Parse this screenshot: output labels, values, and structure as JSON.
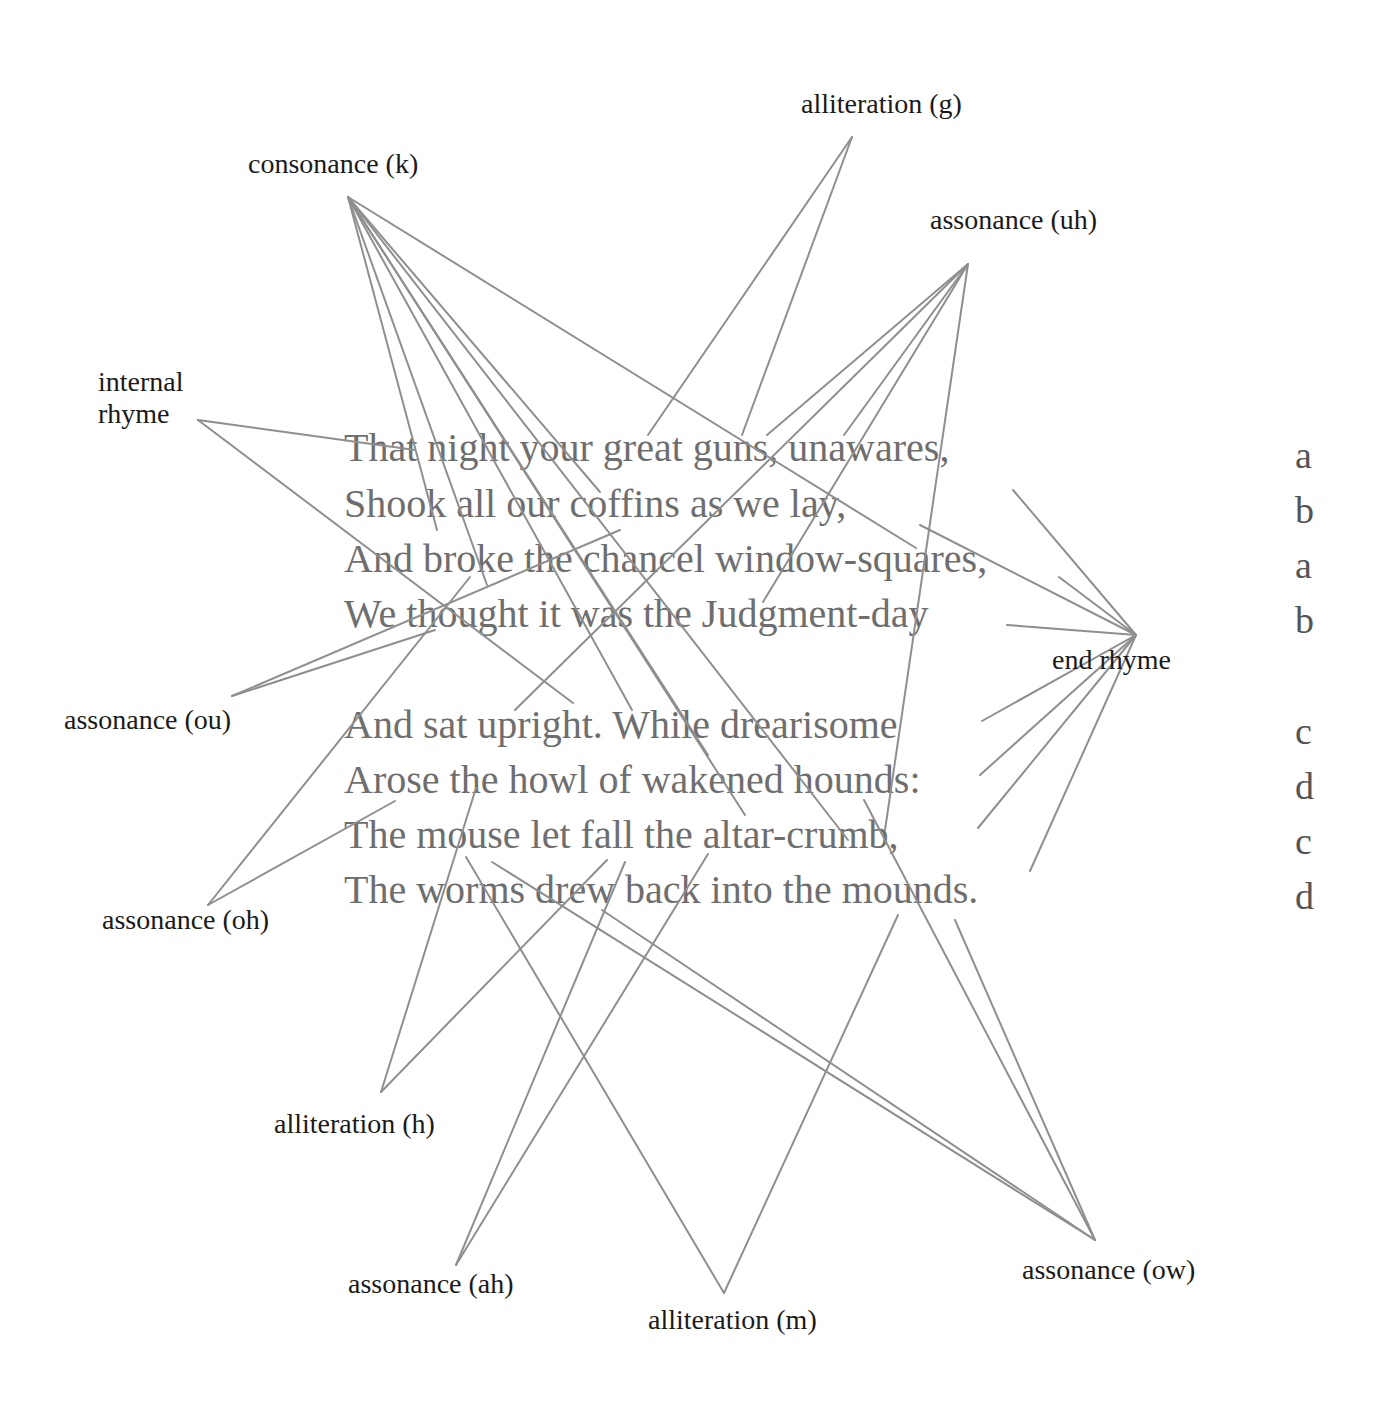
{
  "poem": {
    "stanzas": [
      {
        "lines": [
          {
            "text": "That night your great guns, unawares,",
            "rhyme": "a"
          },
          {
            "text": "Shook all our coffins as we lay,",
            "rhyme": "b"
          },
          {
            "text": "And broke the chancel window-squares,",
            "rhyme": "a"
          },
          {
            "text": "We thought it was the Judgment-day",
            "rhyme": "b"
          }
        ]
      },
      {
        "lines": [
          {
            "text": "And sat upright. While drearisome",
            "rhyme": "c"
          },
          {
            "text": "Arose the howl of wakened hounds:",
            "rhyme": "d"
          },
          {
            "text": "The mouse let fall the altar-crumb,",
            "rhyme": "c"
          },
          {
            "text": "The worms drew back into the mounds.",
            "rhyme": "d"
          }
        ]
      }
    ]
  },
  "labels": {
    "alliteration_g": "alliteration (g)",
    "consonance_k": "consonance (k)",
    "assonance_uh": "assonance (uh)",
    "internal_rhyme_line1": "internal",
    "internal_rhyme_line2": "rhyme",
    "assonance_ou": "assonance (ou)",
    "end_rhyme": "end rhyme",
    "assonance_oh": "assonance (oh)",
    "alliteration_h": "alliteration (h)",
    "assonance_ah": "assonance (ah)",
    "alliteration_m": "alliteration (m)",
    "assonance_ow": "assonance (ow)"
  },
  "colors": {
    "connector": "#8f8f8f",
    "poem_text": "#6e6e6e",
    "label_text": "#1a1a1a",
    "background": "#ffffff"
  },
  "chart_data": {
    "type": "diagram",
    "title": "",
    "nodes": [
      {
        "id": "alliteration_g",
        "label": "alliteration (g)",
        "anchor": [
          852,
          137
        ]
      },
      {
        "id": "consonance_k",
        "label": "consonance (k)",
        "anchor": [
          348,
          197
        ]
      },
      {
        "id": "assonance_uh",
        "label": "assonance (uh)",
        "anchor": [
          968,
          264
        ]
      },
      {
        "id": "internal_rhyme",
        "label": "internal rhyme",
        "anchor": [
          198,
          420
        ]
      },
      {
        "id": "assonance_ou",
        "label": "assonance (ou)",
        "anchor": [
          232,
          696
        ]
      },
      {
        "id": "end_rhyme",
        "label": "end rhyme",
        "anchor": [
          1136,
          635
        ]
      },
      {
        "id": "assonance_oh",
        "label": "assonance (oh)",
        "anchor": [
          208,
          905
        ]
      },
      {
        "id": "alliteration_h",
        "label": "alliteration (h)",
        "anchor": [
          381,
          1092
        ]
      },
      {
        "id": "assonance_ah",
        "label": "assonance (ah)",
        "anchor": [
          456,
          1265
        ]
      },
      {
        "id": "alliteration_m",
        "label": "alliteration (m)",
        "anchor": [
          724,
          1293
        ]
      },
      {
        "id": "assonance_ow",
        "label": "assonance (ow)",
        "anchor": [
          1095,
          1240
        ]
      }
    ],
    "edges": [
      {
        "from": "alliteration_g",
        "to": [
          648,
          435
        ]
      },
      {
        "from": "alliteration_g",
        "to": [
          742,
          435
        ]
      },
      {
        "from": "consonance_k",
        "to": [
          437,
          530
        ]
      },
      {
        "from": "consonance_k",
        "to": [
          487,
          585
        ]
      },
      {
        "from": "consonance_k",
        "to": [
          600,
          492
        ]
      },
      {
        "from": "consonance_k",
        "to": [
          632,
          710
        ]
      },
      {
        "from": "consonance_k",
        "to": [
          708,
          755
        ]
      },
      {
        "from": "consonance_k",
        "to": [
          745,
          815
        ]
      },
      {
        "from": "consonance_k",
        "to": [
          848,
          840
        ]
      },
      {
        "from": "consonance_k",
        "to": [
          916,
          548
        ]
      },
      {
        "from": "assonance_uh",
        "to": [
          767,
          435
        ]
      },
      {
        "from": "assonance_uh",
        "to": [
          844,
          435
        ]
      },
      {
        "from": "assonance_uh",
        "to": [
          763,
          602
        ]
      },
      {
        "from": "assonance_uh",
        "to": [
          515,
          710
        ]
      },
      {
        "from": "assonance_uh",
        "to": [
          885,
          830
        ]
      },
      {
        "from": "internal_rhyme",
        "to": [
          415,
          450
        ]
      },
      {
        "from": "internal_rhyme",
        "to": [
          573,
          703
        ]
      },
      {
        "from": "assonance_ou",
        "to": [
          620,
          530
        ]
      },
      {
        "from": "assonance_ou",
        "to": [
          435,
          630
        ]
      },
      {
        "from": "end_rhyme",
        "to": [
          1013,
          490
        ]
      },
      {
        "from": "end_rhyme",
        "to": [
          920,
          525
        ]
      },
      {
        "from": "end_rhyme",
        "to": [
          1059,
          577
        ]
      },
      {
        "from": "end_rhyme",
        "to": [
          1007,
          625
        ]
      },
      {
        "from": "end_rhyme",
        "to": [
          982,
          721
        ]
      },
      {
        "from": "end_rhyme",
        "to": [
          980,
          775
        ]
      },
      {
        "from": "end_rhyme",
        "to": [
          978,
          828
        ]
      },
      {
        "from": "end_rhyme",
        "to": [
          1030,
          871
        ]
      },
      {
        "from": "assonance_oh",
        "to": [
          470,
          577
        ]
      },
      {
        "from": "assonance_oh",
        "to": [
          395,
          801
        ]
      },
      {
        "from": "alliteration_h",
        "to": [
          476,
          788
        ]
      },
      {
        "from": "alliteration_h",
        "to": [
          607,
          860
        ]
      },
      {
        "from": "assonance_ah",
        "to": [
          625,
          862
        ]
      },
      {
        "from": "assonance_ah",
        "to": [
          708,
          854
        ]
      },
      {
        "from": "alliteration_m",
        "to": [
          466,
          857
        ]
      },
      {
        "from": "alliteration_m",
        "to": [
          898,
          915
        ]
      },
      {
        "from": "assonance_ow",
        "to": [
          492,
          862
        ]
      },
      {
        "from": "assonance_ow",
        "to": [
          602,
          910
        ]
      },
      {
        "from": "assonance_ow",
        "to": [
          864,
          800
        ]
      },
      {
        "from": "assonance_ow",
        "to": [
          955,
          920
        ]
      }
    ]
  }
}
